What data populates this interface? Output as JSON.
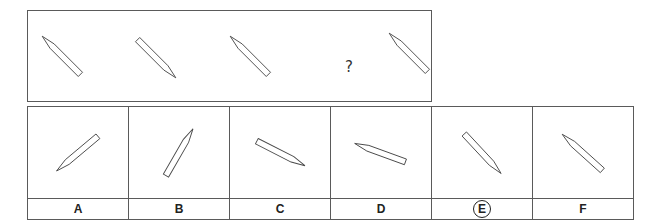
{
  "question": {
    "placeholder": "?",
    "sequence": [
      {
        "position": 1,
        "angle": 45,
        "tip": "top-left"
      },
      {
        "position": 2,
        "angle": 45,
        "tip": "bottom-right"
      },
      {
        "position": 3,
        "angle": 45,
        "tip": "top-left"
      },
      {
        "position": 4,
        "missing": true
      },
      {
        "position": 5,
        "angle": 45,
        "tip": "top-left"
      }
    ]
  },
  "options": [
    {
      "label": "A",
      "tip": "bottom-left",
      "selected": false
    },
    {
      "label": "B",
      "tip": "top-right",
      "selected": false
    },
    {
      "label": "C",
      "tip": "bottom-right",
      "selected": false
    },
    {
      "label": "D",
      "tip": "top-left",
      "selected": false
    },
    {
      "label": "E",
      "tip": "bottom-right",
      "selected": true
    },
    {
      "label": "F",
      "tip": "top-left",
      "selected": false
    }
  ],
  "colors": {
    "stroke": "#4a4a4a",
    "border": "#5a5a5a",
    "background": "#ffffff"
  }
}
